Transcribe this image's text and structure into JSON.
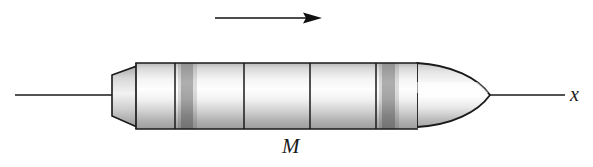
{
  "figure": {
    "type": "physics-diagram",
    "background_color": "#ffffff",
    "ink_color": "#1a1a1a",
    "width": 593,
    "height": 167
  },
  "labels": {
    "mass": "M",
    "axis": "x"
  },
  "axis": {
    "name": "x-axis",
    "orientation": "horizontal",
    "y": 95,
    "x_start": 15,
    "x_end": 565,
    "stroke_width": 1.6,
    "color": "#1a1a1a",
    "label": "x",
    "label_x": 570,
    "label_y": 84
  },
  "motion_arrow": {
    "name": "velocity-direction-arrow",
    "direction": "right",
    "y": 18,
    "x_start": 215,
    "x_tip": 322,
    "shaft_width": 1.7,
    "head_length": 17,
    "head_half_height": 5.5,
    "color": "#111111"
  },
  "rocket": {
    "body": {
      "name": "rocket-cylinder-body",
      "x_left": 136,
      "x_right": 417,
      "y_top": 63,
      "y_bottom": 129,
      "outline_color": "#1a1a1a",
      "outline_width": 1.6,
      "fill_light": "#fdfdfd",
      "fill_shadow": "#9a9a9a"
    },
    "nose": {
      "name": "rocket-nose-cone",
      "shape": "ogive",
      "x_base": 417,
      "x_tip": 490,
      "y_center": 95,
      "outline_color": "#1a1a1a",
      "outline_width": 1.8
    },
    "nozzle": {
      "name": "rocket-tail-nozzle",
      "shape": "trapezoid",
      "x_left": 112,
      "x_right": 137,
      "y_left_top": 75,
      "y_left_bottom": 116,
      "y_right_top": 66,
      "y_right_bottom": 127,
      "outline_color": "#1a1a1a",
      "outline_width": 1.6
    },
    "segment_dividers": [
      {
        "name": "segment-divider-1",
        "x": 175
      },
      {
        "name": "segment-divider-2",
        "x": 244
      },
      {
        "name": "segment-divider-3",
        "x": 310
      },
      {
        "name": "segment-divider-4",
        "x": 376
      }
    ],
    "bands": [
      {
        "name": "stage-band-forward",
        "x_start": 181,
        "x_end": 193,
        "color": "#7d7d7d"
      },
      {
        "name": "stage-band-aft",
        "x_start": 382,
        "x_end": 395,
        "color": "#7d7d7d"
      }
    ]
  },
  "gradients": {
    "cylinder_stops": [
      {
        "offset": "0%",
        "color": "#b9b9b9"
      },
      {
        "offset": "8%",
        "color": "#d9d9d9"
      },
      {
        "offset": "24%",
        "color": "#f4f4f4"
      },
      {
        "offset": "40%",
        "color": "#fefefe"
      },
      {
        "offset": "55%",
        "color": "#f2f2f2"
      },
      {
        "offset": "72%",
        "color": "#d2d2d2"
      },
      {
        "offset": "88%",
        "color": "#b0b0b0"
      },
      {
        "offset": "100%",
        "color": "#9d9d9d"
      }
    ],
    "band_stops": [
      {
        "offset": "0%",
        "color": "#8e8e8e"
      },
      {
        "offset": "30%",
        "color": "#a8a8a8"
      },
      {
        "offset": "55%",
        "color": "#9b9b9b"
      },
      {
        "offset": "80%",
        "color": "#7c7c7c"
      },
      {
        "offset": "100%",
        "color": "#6e6e6e"
      }
    ],
    "nozzle_stops": [
      {
        "offset": "0%",
        "color": "#a8a8a8"
      },
      {
        "offset": "20%",
        "color": "#d8d8d8"
      },
      {
        "offset": "45%",
        "color": "#f2f2f2"
      },
      {
        "offset": "70%",
        "color": "#cfcfcf"
      },
      {
        "offset": "100%",
        "color": "#9a9a9a"
      }
    ]
  }
}
